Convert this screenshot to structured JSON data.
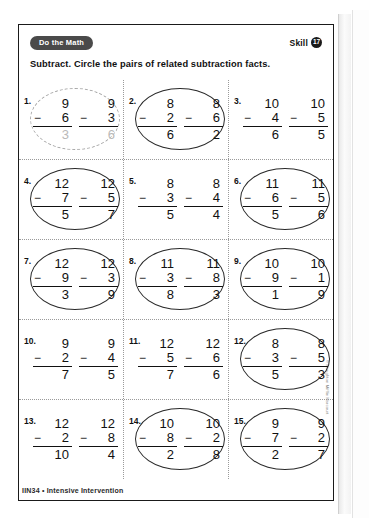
{
  "header": {
    "badge_label": "Do the Math",
    "skill_label": "Skill",
    "skill_number": "17"
  },
  "directions": "Subtract. Circle the pairs of related subtraction facts.",
  "footer": {
    "text": "IIN34 • Intensive Intervention",
    "copyright": "© Houghton Mifflin Harcourt"
  },
  "problems": [
    {
      "number": "1.",
      "circled": true,
      "circle_style": "dashed",
      "sample": true,
      "facts": [
        {
          "minuend": "9",
          "operator": "−",
          "subtrahend": "6",
          "answer": "3"
        },
        {
          "minuend": "9",
          "operator": "−",
          "subtrahend": "3",
          "answer": "6"
        }
      ]
    },
    {
      "number": "2.",
      "circled": true,
      "circle_style": "solid",
      "sample": false,
      "facts": [
        {
          "minuend": "8",
          "operator": "−",
          "subtrahend": "2",
          "answer": "6"
        },
        {
          "minuend": "8",
          "operator": "−",
          "subtrahend": "6",
          "answer": "2"
        }
      ]
    },
    {
      "number": "3.",
      "circled": false,
      "circle_style": "none",
      "sample": false,
      "facts": [
        {
          "minuend": "10",
          "operator": "−",
          "subtrahend": "4",
          "answer": "6"
        },
        {
          "minuend": "10",
          "operator": "−",
          "subtrahend": "5",
          "answer": "5"
        }
      ]
    },
    {
      "number": "4.",
      "circled": true,
      "circle_style": "solid",
      "sample": false,
      "facts": [
        {
          "minuend": "12",
          "operator": "−",
          "subtrahend": "7",
          "answer": "5"
        },
        {
          "minuend": "12",
          "operator": "−",
          "subtrahend": "5",
          "answer": "7"
        }
      ]
    },
    {
      "number": "5.",
      "circled": false,
      "circle_style": "none",
      "sample": false,
      "facts": [
        {
          "minuend": "8",
          "operator": "−",
          "subtrahend": "3",
          "answer": "5"
        },
        {
          "minuend": "8",
          "operator": "−",
          "subtrahend": "4",
          "answer": "4"
        }
      ]
    },
    {
      "number": "6.",
      "circled": true,
      "circle_style": "solid",
      "sample": false,
      "facts": [
        {
          "minuend": "11",
          "operator": "−",
          "subtrahend": "6",
          "answer": "5"
        },
        {
          "minuend": "11",
          "operator": "−",
          "subtrahend": "5",
          "answer": "6"
        }
      ]
    },
    {
      "number": "7.",
      "circled": true,
      "circle_style": "solid",
      "sample": false,
      "facts": [
        {
          "minuend": "12",
          "operator": "−",
          "subtrahend": "9",
          "answer": "3"
        },
        {
          "minuend": "12",
          "operator": "−",
          "subtrahend": "3",
          "answer": "9"
        }
      ]
    },
    {
      "number": "8.",
      "circled": true,
      "circle_style": "solid",
      "sample": false,
      "facts": [
        {
          "minuend": "11",
          "operator": "−",
          "subtrahend": "3",
          "answer": "8"
        },
        {
          "minuend": "11",
          "operator": "−",
          "subtrahend": "8",
          "answer": "3"
        }
      ]
    },
    {
      "number": "9.",
      "circled": true,
      "circle_style": "solid",
      "sample": false,
      "facts": [
        {
          "minuend": "10",
          "operator": "−",
          "subtrahend": "9",
          "answer": "1"
        },
        {
          "minuend": "10",
          "operator": "−",
          "subtrahend": "1",
          "answer": "9"
        }
      ]
    },
    {
      "number": "10.",
      "circled": false,
      "circle_style": "none",
      "sample": false,
      "facts": [
        {
          "minuend": "9",
          "operator": "−",
          "subtrahend": "2",
          "answer": "7"
        },
        {
          "minuend": "9",
          "operator": "−",
          "subtrahend": "4",
          "answer": "5"
        }
      ]
    },
    {
      "number": "11.",
      "circled": false,
      "circle_style": "none",
      "sample": false,
      "facts": [
        {
          "minuend": "12",
          "operator": "−",
          "subtrahend": "5",
          "answer": "7"
        },
        {
          "minuend": "12",
          "operator": "−",
          "subtrahend": "6",
          "answer": "6"
        }
      ]
    },
    {
      "number": "12.",
      "circled": true,
      "circle_style": "solid",
      "sample": false,
      "facts": [
        {
          "minuend": "8",
          "operator": "−",
          "subtrahend": "3",
          "answer": "5"
        },
        {
          "minuend": "8",
          "operator": "−",
          "subtrahend": "5",
          "answer": "3"
        }
      ]
    },
    {
      "number": "13.",
      "circled": false,
      "circle_style": "none",
      "sample": false,
      "facts": [
        {
          "minuend": "12",
          "operator": "−",
          "subtrahend": "2",
          "answer": "10"
        },
        {
          "minuend": "12",
          "operator": "−",
          "subtrahend": "8",
          "answer": "4"
        }
      ]
    },
    {
      "number": "14.",
      "circled": true,
      "circle_style": "solid",
      "sample": false,
      "facts": [
        {
          "minuend": "10",
          "operator": "−",
          "subtrahend": "8",
          "answer": "2"
        },
        {
          "minuend": "10",
          "operator": "−",
          "subtrahend": "2",
          "answer": "8"
        }
      ]
    },
    {
      "number": "15.",
      "circled": true,
      "circle_style": "solid",
      "sample": false,
      "facts": [
        {
          "minuend": "9",
          "operator": "−",
          "subtrahend": "7",
          "answer": "2"
        },
        {
          "minuend": "9",
          "operator": "−",
          "subtrahend": "2",
          "answer": "7"
        }
      ]
    }
  ]
}
